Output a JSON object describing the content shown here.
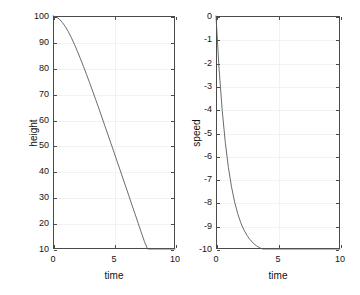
{
  "figure": {
    "background_color": "#ffffff",
    "axis_color": "#4a4a4a",
    "grid_color": "#f2f2f5",
    "line_color": "#5a5a5a"
  },
  "chart_data": [
    {
      "type": "line",
      "title": "",
      "subplot_index": 1,
      "xlabel": "time",
      "ylabel": "height",
      "xlim": [
        0,
        10
      ],
      "ylim": [
        10,
        100
      ],
      "xticks": [
        0,
        5,
        10
      ],
      "xticklabels": [
        "0",
        "5",
        "10"
      ],
      "yticks": [
        10,
        20,
        30,
        40,
        50,
        60,
        70,
        80,
        90,
        100
      ],
      "yticklabels": [
        "10",
        "20",
        "30",
        "40",
        "50",
        "60",
        "70",
        "80",
        "90",
        "100"
      ],
      "grid": true,
      "legend": "none",
      "series": [
        {
          "name": "height",
          "x": [
            0,
            0.25,
            0.5,
            0.75,
            1,
            1.25,
            1.5,
            1.75,
            2,
            2.25,
            2.5,
            2.75,
            3,
            3.25,
            3.5,
            3.75,
            4,
            4.25,
            4.5,
            4.75,
            5,
            5.25,
            5.5,
            5.75,
            6,
            6.25,
            6.5,
            6.75,
            7,
            7.25,
            7.5,
            7.75,
            8,
            8.25,
            8.5,
            8.75,
            9,
            9.25,
            9.5,
            9.75,
            10
          ],
          "values": [
            100.0,
            99.7,
            98.9,
            97.6,
            96.0,
            94.0,
            91.7,
            89.1,
            86.4,
            83.5,
            80.5,
            77.4,
            74.2,
            71.0,
            67.7,
            64.4,
            61.0,
            57.6,
            54.2,
            50.8,
            47.4,
            43.9,
            40.5,
            37.0,
            33.6,
            30.1,
            26.6,
            23.2,
            19.7,
            16.2,
            12.8,
            9.3,
            10.0,
            10.0,
            10.0,
            10.0,
            10.0,
            10.0,
            10.0,
            10.0,
            10.0
          ]
        }
      ]
    },
    {
      "type": "line",
      "title": "",
      "subplot_index": 2,
      "xlabel": "time",
      "ylabel": "speed",
      "xlim": [
        0,
        10
      ],
      "ylim": [
        -10,
        0
      ],
      "xticks": [
        0,
        5,
        10
      ],
      "xticklabels": [
        "0",
        "5",
        "10"
      ],
      "yticks": [
        -10,
        -9,
        -8,
        -7,
        -6,
        -5,
        -4,
        -3,
        -2,
        -1,
        0
      ],
      "yticklabels": [
        "-10",
        "-9",
        "-8",
        "-7",
        "-6",
        "-5",
        "-4",
        "-3",
        "-2",
        "-1",
        "0"
      ],
      "grid": true,
      "legend": "none",
      "series": [
        {
          "name": "speed",
          "x": [
            0,
            0.25,
            0.5,
            0.75,
            1,
            1.25,
            1.5,
            1.75,
            2,
            2.25,
            2.5,
            2.75,
            3,
            3.25,
            3.5,
            3.75,
            4,
            4.25,
            4.5,
            4.75,
            5,
            5.5,
            6,
            6.5,
            7,
            7.5,
            8,
            8.5,
            9,
            9.5,
            10
          ],
          "values": [
            0.0,
            -2.28,
            -4.05,
            -5.43,
            -6.5,
            -7.33,
            -7.98,
            -8.48,
            -8.88,
            -9.18,
            -9.42,
            -9.6,
            -9.75,
            -9.86,
            -9.94,
            -10.01,
            -10.06,
            -10.1,
            -10.13,
            -10.15,
            -10.17,
            -10.19,
            -10.21,
            -10.22,
            -10.22,
            -10.22,
            -10.23,
            -10.23,
            -10.23,
            -10.23,
            -10.23
          ]
        }
      ]
    }
  ]
}
